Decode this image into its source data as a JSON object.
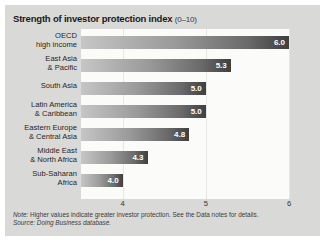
{
  "figure": {
    "title_main": "Strength of investor protection index",
    "title_range": "(0–10)",
    "note": "Higher values indicate greater investor protection. See the Data notes for details.",
    "note_prefix": "Note:",
    "source": "Doing Business database.",
    "source_prefix": "Source:"
  },
  "chart_data": {
    "type": "bar",
    "orientation": "horizontal",
    "title": "Strength of investor protection index (0–10)",
    "xlabel": "",
    "ylabel": "",
    "xlim": [
      3.5,
      6.0
    ],
    "xticks": [
      "4",
      "5",
      "6"
    ],
    "xtick_values": [
      4,
      5,
      6
    ],
    "grid": true,
    "legend": "none",
    "categories": [
      "OECD\nhigh income",
      "East Asia\n& Pacific",
      "South Asia",
      "Latin America\n& Caribbean",
      "Eastern Europe\n& Central Asia",
      "Middle East\n& North Africa",
      "Sub-Saharan\nAfrica"
    ],
    "values": [
      6.0,
      5.3,
      5.0,
      5.0,
      4.8,
      4.3,
      4.0
    ],
    "value_labels": [
      "6.0",
      "5.3",
      "5.0",
      "5.0",
      "4.8",
      "4.3",
      "4.0"
    ],
    "rows": [
      {
        "line1": "OECD",
        "line2": "high income",
        "value": 6.0,
        "label": "6.0"
      },
      {
        "line1": "East Asia",
        "line2": "& Pacific",
        "value": 5.3,
        "label": "5.3"
      },
      {
        "line1": "South Asia",
        "line2": "",
        "value": 5.0,
        "label": "5.0"
      },
      {
        "line1": "Latin America",
        "line2": "& Caribbean",
        "value": 5.0,
        "label": "5.0"
      },
      {
        "line1": "Eastern Europe",
        "line2": "& Central Asia",
        "value": 4.8,
        "label": "4.8"
      },
      {
        "line1": "Middle East",
        "line2": "& North Africa",
        "value": 4.3,
        "label": "4.3"
      },
      {
        "line1": "Sub-Saharan",
        "line2": "Africa",
        "value": 4.0,
        "label": "4.0"
      }
    ],
    "colors": {
      "bar_gradient_start": "#c6c6c6",
      "bar_gradient_end": "#3f3f3f",
      "plot_background": "#fbfbfa",
      "card_background": "#d9d9d7",
      "gridline": "#e6e6e4",
      "value_label": "#ffffff"
    }
  }
}
